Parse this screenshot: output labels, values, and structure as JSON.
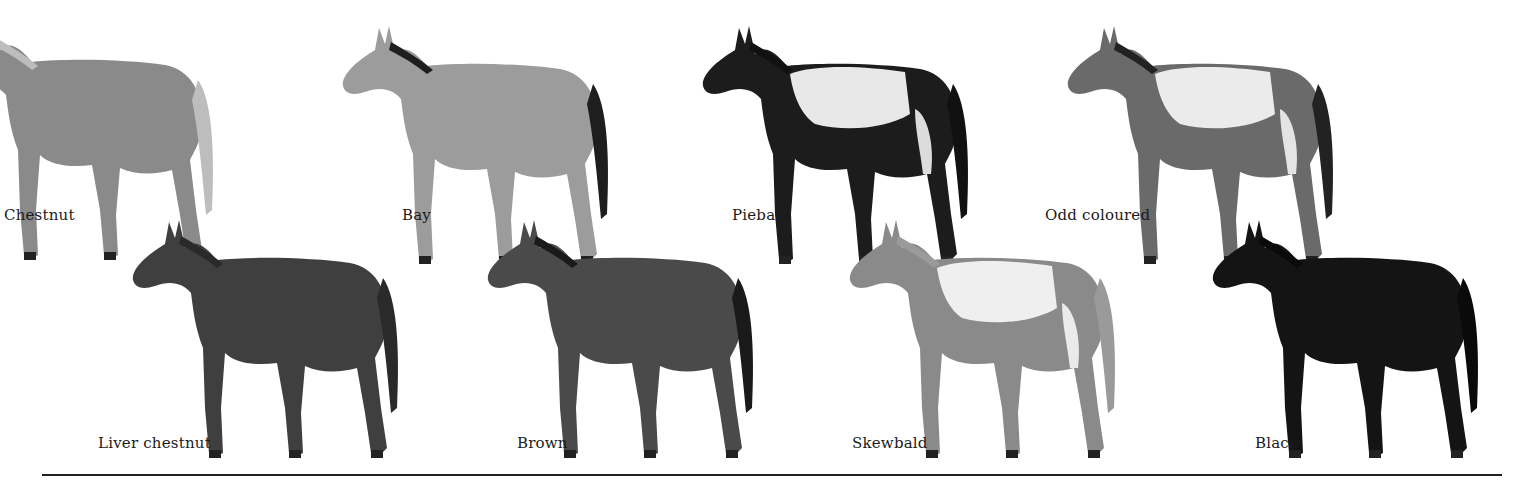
{
  "figure": {
    "top_row": [
      {
        "label": "Chestnut",
        "body": "#8a8a8a",
        "mane": "#bdbdbd",
        "patch": null,
        "x": -60,
        "y": 10,
        "label_x": 4,
        "label_y": 206
      },
      {
        "label": "Bay",
        "body": "#9c9c9c",
        "mane": "#1e1e1e",
        "patch": null,
        "x": 335,
        "y": 14,
        "label_x": 402,
        "label_y": 206
      },
      {
        "label": "Piebald",
        "body": "#1c1c1c",
        "mane": "#111111",
        "patch": "#f2f2f2",
        "x": 695,
        "y": 14,
        "label_x": 732,
        "label_y": 206
      },
      {
        "label": "Odd coloured",
        "body": "#6a6a6a",
        "mane": "#222222",
        "patch": "#f2f2f2",
        "x": 1060,
        "y": 14,
        "label_x": 1045,
        "label_y": 206
      }
    ],
    "bottom_row": [
      {
        "label": "Liver chestnut",
        "body": "#3f3f3f",
        "mane": "#2a2a2a",
        "patch": null,
        "x": 125,
        "y": 208,
        "label_x": 98,
        "label_y": 434
      },
      {
        "label": "Brown",
        "body": "#4a4a4a",
        "mane": "#1a1a1a",
        "patch": null,
        "x": 480,
        "y": 208,
        "label_x": 517,
        "label_y": 434
      },
      {
        "label": "Skewbald",
        "body": "#8a8a8a",
        "mane": "#9a9a9a",
        "patch": "#f4f4f4",
        "x": 842,
        "y": 208,
        "label_x": 852,
        "label_y": 434
      },
      {
        "label": "Black",
        "body": "#141414",
        "mane": "#0a0a0a",
        "patch": null,
        "x": 1205,
        "y": 208,
        "label_x": 1255,
        "label_y": 434
      }
    ]
  }
}
